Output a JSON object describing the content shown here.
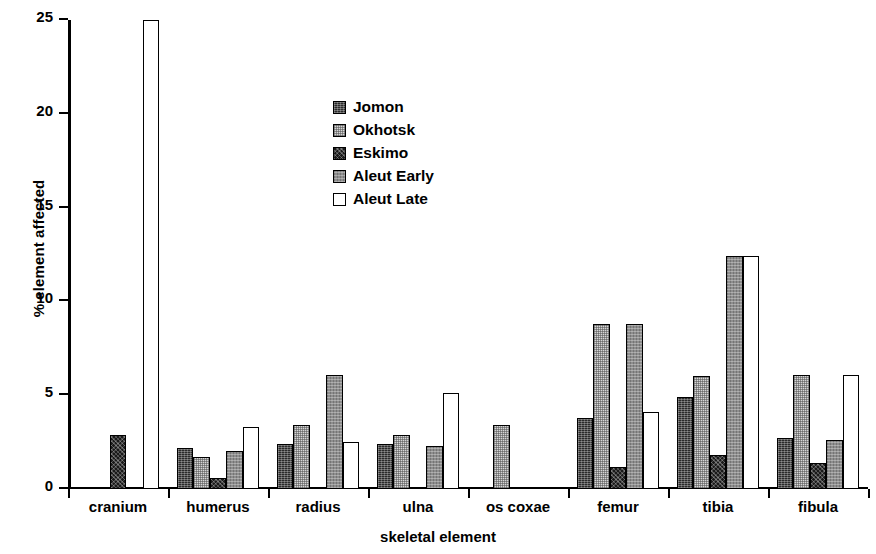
{
  "chart_data": {
    "type": "bar",
    "title": "",
    "xlabel": "skeletal element",
    "ylabel": "% element affected",
    "categories": [
      "cranium",
      "humerus",
      "radius",
      "ulna",
      "os coxae",
      "femur",
      "tibia",
      "fibula"
    ],
    "series": [
      {
        "name": "Jomon",
        "key": "jomon",
        "swatch": "dark-speckle",
        "values": [
          0,
          2.2,
          2.4,
          2.4,
          0,
          3.8,
          4.9,
          2.7
        ]
      },
      {
        "name": "Okhotsk",
        "key": "okhotsk",
        "swatch": "light-speckle",
        "values": [
          0,
          1.7,
          3.4,
          2.9,
          3.4,
          8.8,
          6.0,
          6.1
        ]
      },
      {
        "name": "Eskimo",
        "key": "eskimo",
        "swatch": "black-hatch",
        "values": [
          2.9,
          0.6,
          0,
          0,
          0,
          1.2,
          1.8,
          1.4
        ]
      },
      {
        "name": "Aleut Early",
        "key": "aleut_early",
        "swatch": "gray-speckle",
        "values": [
          0,
          2.0,
          6.1,
          2.3,
          0,
          8.8,
          12.4,
          2.6
        ]
      },
      {
        "name": "Aleut Late",
        "key": "aleut_late",
        "swatch": "white",
        "values": [
          25.0,
          3.3,
          2.5,
          5.1,
          0,
          4.1,
          12.4,
          6.1
        ]
      }
    ],
    "ylim": [
      0,
      25
    ],
    "yticks": [
      0,
      5,
      10,
      15,
      20,
      25
    ],
    "ytick_labels": [
      "0",
      "5",
      "10",
      "15",
      "20",
      "25"
    ],
    "grid": false,
    "legend_position": "inside-upper-center"
  },
  "legend": {
    "items": [
      {
        "label": "Jomon"
      },
      {
        "label": "Okhotsk"
      },
      {
        "label": "Eskimo"
      },
      {
        "label": "Aleut Early"
      },
      {
        "label": "Aleut Late"
      }
    ]
  }
}
